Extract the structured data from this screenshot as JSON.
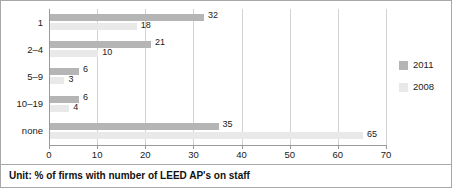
{
  "chart_data": {
    "type": "bar",
    "orientation": "horizontal",
    "title": "",
    "subtitle": "",
    "xlabel": "",
    "ylabel": "",
    "categories": [
      "1",
      "2–4",
      "5–9",
      "10–19",
      "none"
    ],
    "series": [
      {
        "name": "2011",
        "values": [
          32,
          21,
          6,
          6,
          35
        ],
        "color": "#b5b5b5"
      },
      {
        "name": "2008",
        "values": [
          18,
          10,
          3,
          4,
          65
        ],
        "color": "#e9e9e9"
      }
    ],
    "xlim": [
      0,
      70
    ],
    "xticks": [
      0,
      10,
      20,
      30,
      40,
      50,
      60,
      70
    ],
    "xtick_labels": [
      "0",
      "10",
      "20",
      "30",
      "40",
      "50",
      "60",
      "70"
    ],
    "grid": true,
    "grid_axis": "x",
    "legend_position": "right",
    "annotation": "Unit: % of firms with number of LEED AP's on staff"
  },
  "legend": {
    "entries": [
      {
        "label": "2011",
        "color": "#b5b5b5"
      },
      {
        "label": "2008",
        "color": "#e9e9e9"
      }
    ]
  },
  "caption": {
    "text": "Unit: % of firms with number of LEED AP's on staff"
  }
}
